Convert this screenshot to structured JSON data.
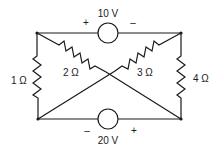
{
  "diagram": {
    "type": "circuit",
    "nodes": {
      "top_left": [
        37,
        33
      ],
      "top_right": [
        181,
        33
      ],
      "bottom_left": [
        38,
        119
      ],
      "bottom_right": [
        181,
        119
      ]
    },
    "sources": [
      {
        "id": "top_source",
        "value": "10 V",
        "plus": "+",
        "minus": "–",
        "plus_side": "left",
        "minus_side": "right"
      },
      {
        "id": "bottom_source",
        "value": "20 V",
        "plus": "+",
        "minus": "–",
        "plus_side": "right",
        "minus_side": "left"
      }
    ],
    "resistors": [
      {
        "id": "r_left",
        "label": "1 Ω",
        "from": "top_left",
        "to": "bottom_left"
      },
      {
        "id": "r_diag_a",
        "label": "2 Ω",
        "from": "top_left",
        "to": "bottom_right"
      },
      {
        "id": "r_diag_b",
        "label": "3 Ω",
        "from": "top_right",
        "to": "bottom_left"
      },
      {
        "id": "r_right",
        "label": "4 Ω",
        "from": "top_right",
        "to": "bottom_right"
      }
    ]
  },
  "colors": {
    "line": "#1a1a1a",
    "background": "#ffffff"
  }
}
